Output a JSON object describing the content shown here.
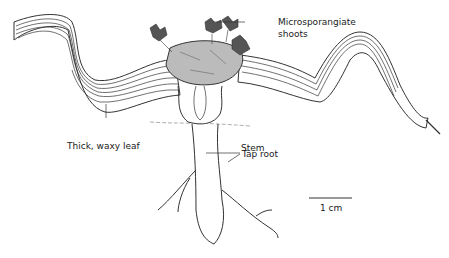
{
  "figure": {
    "labels": {
      "microsporangiate_1": "Microsporangiate",
      "microsporangiate_2": "shoots",
      "stem": "Stem",
      "leaf": "Thick, waxy leaf",
      "tap_root": "Tap root",
      "scale": "1 cm"
    },
    "colors": {
      "ink": "#222222",
      "background": "#ffffff"
    }
  }
}
